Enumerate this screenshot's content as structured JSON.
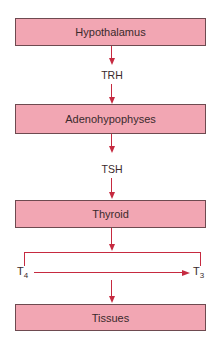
{
  "diagram": {
    "nodes": [
      {
        "id": "hypothalamus",
        "label": "Hypothalamus"
      },
      {
        "id": "adenohypophyses",
        "label": "Adenohypophyses"
      },
      {
        "id": "thyroid",
        "label": "Thyroid"
      },
      {
        "id": "tissues",
        "label": "Tissues"
      }
    ],
    "edges": [
      {
        "from": "hypothalamus",
        "to": "adenohypophyses",
        "label": "TRH"
      },
      {
        "from": "adenohypophyses",
        "to": "thyroid",
        "label": "TSH"
      },
      {
        "from": "thyroid",
        "to": "tissues",
        "label": ""
      }
    ],
    "conversion": {
      "from_base": "T",
      "from_sub": "4",
      "to_base": "T",
      "to_sub": "3"
    },
    "colors": {
      "box_fill": "#f2a6b3",
      "box_border": "#6e4a50",
      "arrow": "#c62a40",
      "text": "#3a2a2c"
    }
  }
}
